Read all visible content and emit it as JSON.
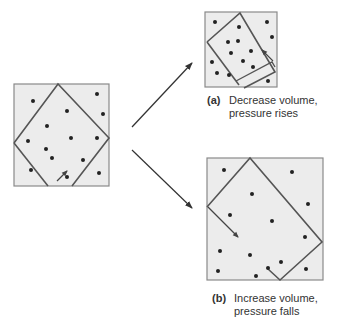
{
  "colors": {
    "box_fill": "#ececec",
    "box_stroke": "#8a8a8a",
    "piston_stroke": "#555555",
    "dot": "#222222",
    "arrow": "#333333"
  },
  "panels": {
    "initial": {
      "box": {
        "x": 14,
        "y": 84,
        "w": 95,
        "h": 102
      },
      "container_points": "58,84 109,138 70,186 67,181 48,186 14,143",
      "motion_arrow": {
        "x1": 56,
        "y1": 183,
        "x2": 66,
        "y2": 171
      },
      "dots": [
        [
          33,
          101
        ],
        [
          97,
          94
        ],
        [
          67,
          111
        ],
        [
          103,
          114
        ],
        [
          47,
          126
        ],
        [
          71,
          138
        ],
        [
          97,
          138
        ],
        [
          28,
          141
        ],
        [
          46,
          149
        ],
        [
          52,
          158
        ],
        [
          83,
          160
        ],
        [
          31,
          170
        ],
        [
          99,
          173
        ],
        [
          67,
          178
        ]
      ]
    },
    "a": {
      "box": {
        "x": 205,
        "y": 12,
        "w": 72,
        "h": 75
      },
      "container_points": "207,42 240,13 275,66 244,82 245,80 241,82 245,87 240,82",
      "dots": [
        [
          215,
          22
        ],
        [
          239,
          26
        ],
        [
          266,
          22
        ],
        [
          272,
          37
        ],
        [
          228,
          42
        ],
        [
          238,
          42
        ],
        [
          231,
          53
        ],
        [
          251,
          51
        ],
        [
          212,
          62
        ],
        [
          243,
          61
        ],
        [
          253,
          67
        ],
        [
          217,
          73
        ],
        [
          229,
          75
        ],
        [
          268,
          81
        ]
      ],
      "caption": {
        "tag": "(a)",
        "line1": "Decrease volume,",
        "line2": "pressure rises"
      }
    },
    "b": {
      "box": {
        "x": 207,
        "y": 158,
        "w": 116,
        "h": 122
      },
      "container_points": "250,158 322,242 280,280 268,268 250,268",
      "dots": [
        [
          224,
          170
        ],
        [
          292,
          172
        ],
        [
          252,
          194
        ],
        [
          308,
          204
        ],
        [
          230,
          215
        ],
        [
          272,
          221
        ],
        [
          305,
          237
        ],
        [
          220,
          251
        ],
        [
          250,
          255
        ],
        [
          281,
          262
        ],
        [
          218,
          271
        ],
        [
          256,
          270
        ],
        [
          230,
          276
        ],
        [
          306,
          269
        ]
      ],
      "caption": {
        "tag": "(b)",
        "line1": "Increase volume,",
        "line2": "pressure falls"
      }
    }
  },
  "arrows": [
    {
      "name": "arrow-to-a",
      "x1": 132,
      "y1": 128,
      "x2": 193,
      "y2": 64
    },
    {
      "name": "arrow-to-b",
      "x1": 132,
      "y1": 150,
      "x2": 193,
      "y2": 208
    }
  ]
}
